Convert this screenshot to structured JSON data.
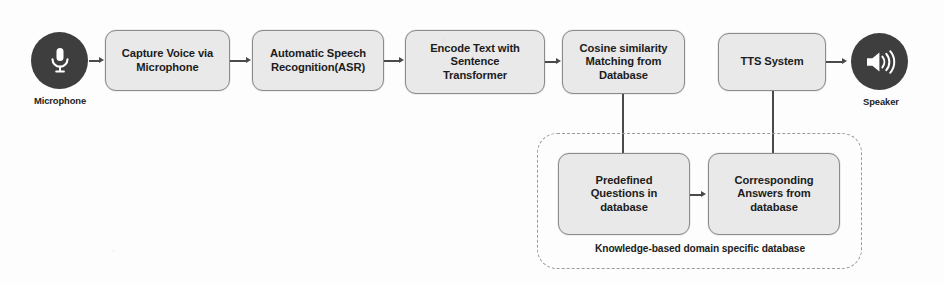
{
  "diagram": {
    "background_color": "#fdfdfd",
    "node_fill": "#e9e9e9",
    "node_border": "#8b8b8b",
    "connector_color": "#4a4a4a",
    "icon_circle_color": "#3e3e3e"
  },
  "endpoints": {
    "input": {
      "icon": "microphone-icon",
      "label": "Microphone"
    },
    "output": {
      "icon": "speaker-icon",
      "label": "Speaker"
    }
  },
  "nodes": [
    {
      "id": "capture-voice",
      "label": "Capture Voice via\nMicrophone"
    },
    {
      "id": "asr",
      "label": "Automatic Speech\nRecognition(ASR)"
    },
    {
      "id": "encode-text",
      "label": "Encode Text with\nSentence\nTransformer"
    },
    {
      "id": "cosine-matching",
      "label": "Cosine similarity\nMatching from\nDatabase"
    },
    {
      "id": "tts-system",
      "label": "TTS System"
    },
    {
      "id": "predefined-questions",
      "label": "Predefined\nQuestions in\ndatabase"
    },
    {
      "id": "corresponding-answers",
      "label": "Corresponding\nAnswers from\ndatabase"
    }
  ],
  "group": {
    "id": "knowledge-database-group",
    "caption": "Knowledge-based domain specific database"
  }
}
